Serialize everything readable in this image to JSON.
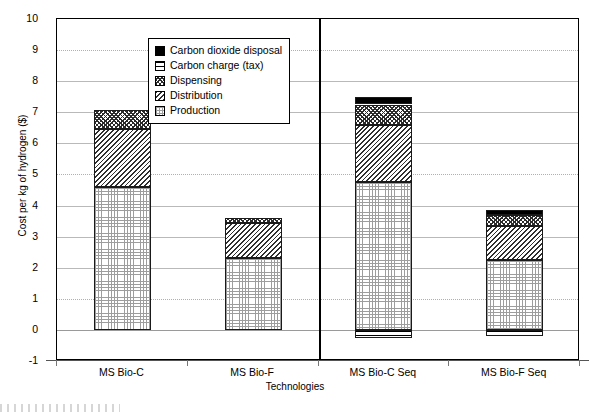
{
  "chart_data": {
    "type": "bar",
    "subtype": "stacked-bar",
    "title": "",
    "xlabel": "Technologies",
    "ylabel": "Cost per kg of hydrogen ($)",
    "ylim": [
      -1,
      10
    ],
    "ytick_step": 1,
    "yticks": [
      "10",
      "9",
      "8",
      "7",
      "6",
      "5",
      "4",
      "3",
      "2",
      "1",
      "0",
      "-1"
    ],
    "grid": true,
    "legend_position": "upper-left-inside",
    "categories": [
      "MS Bio-C",
      "MS Bio-F",
      "MS Bio-C Seq",
      "MS Bio-F Seq"
    ],
    "series": [
      {
        "name": "Production",
        "pattern": "fine-grid",
        "values": [
          4.6,
          2.3,
          4.75,
          2.25
        ]
      },
      {
        "name": "Distribution",
        "pattern": "diagonal-hatch",
        "values": [
          1.85,
          1.15,
          1.85,
          1.1
        ]
      },
      {
        "name": "Dispensing",
        "pattern": "dense-crosshatch",
        "values": [
          0.63,
          0.15,
          0.65,
          0.35
        ]
      },
      {
        "name": "Carbon charge (tax)",
        "pattern": "horizontal-lines",
        "values": [
          0.0,
          0.0,
          -0.25,
          -0.2
        ]
      },
      {
        "name": "Carbon dioxide disposal",
        "pattern": "solid-black",
        "values": [
          0.0,
          0.0,
          0.25,
          0.15
        ]
      }
    ],
    "totals": [
      7.08,
      3.6,
      7.5,
      3.85
    ],
    "bars": [
      {
        "category": "MS Bio-C",
        "segments": [
          {
            "name": "Production",
            "pattern": "fine-grid",
            "from": 0.0,
            "to": 4.6
          },
          {
            "name": "Distribution",
            "pattern": "diagonal-hatch",
            "from": 4.6,
            "to": 6.45
          },
          {
            "name": "Dispensing",
            "pattern": "dense-crosshatch",
            "from": 6.45,
            "to": 7.08
          }
        ]
      },
      {
        "category": "MS Bio-F",
        "segments": [
          {
            "name": "Production",
            "pattern": "fine-grid",
            "from": 0.0,
            "to": 2.3
          },
          {
            "name": "Distribution",
            "pattern": "diagonal-hatch",
            "from": 2.3,
            "to": 3.45
          },
          {
            "name": "Dispensing",
            "pattern": "dense-crosshatch",
            "from": 3.45,
            "to": 3.6
          }
        ]
      },
      {
        "category": "MS Bio-C Seq",
        "segments": [
          {
            "name": "Carbon charge (tax)",
            "pattern": "horizontal-lines",
            "from": -0.25,
            "to": 0.0
          },
          {
            "name": "Production",
            "pattern": "fine-grid",
            "from": 0.0,
            "to": 4.75
          },
          {
            "name": "Distribution",
            "pattern": "diagonal-hatch",
            "from": 4.75,
            "to": 6.6
          },
          {
            "name": "Dispensing",
            "pattern": "dense-crosshatch",
            "from": 6.6,
            "to": 7.25
          },
          {
            "name": "Carbon dioxide disposal",
            "pattern": "solid-black",
            "from": 7.25,
            "to": 7.5
          }
        ]
      },
      {
        "category": "MS Bio-F Seq",
        "segments": [
          {
            "name": "Carbon charge (tax)",
            "pattern": "horizontal-lines",
            "from": -0.2,
            "to": 0.0
          },
          {
            "name": "Production",
            "pattern": "fine-grid",
            "from": 0.0,
            "to": 2.25
          },
          {
            "name": "Distribution",
            "pattern": "diagonal-hatch",
            "from": 2.25,
            "to": 3.35
          },
          {
            "name": "Dispensing",
            "pattern": "dense-crosshatch",
            "from": 3.35,
            "to": 3.7
          },
          {
            "name": "Carbon dioxide disposal",
            "pattern": "solid-black",
            "from": 3.7,
            "to": 3.85
          }
        ]
      }
    ],
    "legend": [
      {
        "label": "Carbon dioxide disposal",
        "pattern": "solid-black"
      },
      {
        "label": "Carbon charge (tax)",
        "pattern": "horizontal-lines"
      },
      {
        "label": "Dispensing",
        "pattern": "dense-crosshatch"
      },
      {
        "label": "Distribution",
        "pattern": "diagonal-hatch"
      },
      {
        "label": "Production",
        "pattern": "fine-grid"
      }
    ],
    "annotations": {
      "group_divider": "vertical rule separating non-sequestration (left) from sequestration (right) technologies"
    },
    "colors": {
      "axis": "#000000",
      "gridline": "#b9b9b9",
      "bar_outline": "#1a1a1a",
      "solid_fill": "#000000",
      "background": "#ffffff"
    }
  }
}
